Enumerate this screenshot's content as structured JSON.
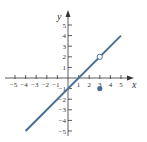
{
  "chart_data": {
    "type": "line",
    "title": "",
    "xlabel": "x",
    "ylabel": "y",
    "xlim": [
      -5,
      5
    ],
    "ylim": [
      -5,
      5
    ],
    "x_ticks": [
      -5,
      -4,
      -3,
      -2,
      -1,
      1,
      2,
      3,
      4,
      5
    ],
    "y_ticks": [
      -5,
      -4,
      -3,
      -2,
      -1,
      1,
      2,
      3,
      4,
      5
    ],
    "grid": false,
    "series": [
      {
        "name": "y = x - 1 (x ≠ 3)",
        "kind": "line",
        "x": [
          -4,
          5
        ],
        "y": [
          -5,
          4
        ],
        "color": "#4a6f96"
      }
    ],
    "points": [
      {
        "name": "open-circle",
        "x": 3,
        "y": 2,
        "filled": false,
        "color": "#4a6f96"
      },
      {
        "name": "filled-point",
        "x": 3,
        "y": -1,
        "filled": true,
        "color": "#4a6f96"
      }
    ]
  },
  "labels": {
    "x_axis": "x",
    "y_axis": "y",
    "x_ticks": [
      "−5",
      "−4",
      "−3",
      "−2",
      "−1",
      "1",
      "2",
      "3",
      "4",
      "5"
    ],
    "y_ticks": [
      "5",
      "4",
      "3",
      "2",
      "1",
      "−1",
      "−2",
      "−3",
      "−4",
      "−5"
    ]
  },
  "colors": {
    "line": "#4a6f96",
    "axis": "#333333"
  }
}
